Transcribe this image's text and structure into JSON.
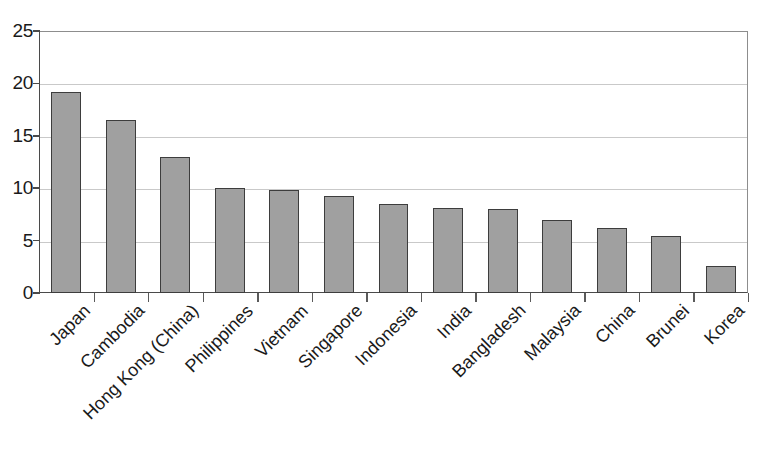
{
  "chart_data": {
    "type": "bar",
    "title": "",
    "subtitle": "",
    "xlabel": "",
    "ylabel": "",
    "ylim": [
      0,
      25
    ],
    "yticks": [
      0,
      5,
      10,
      15,
      20,
      25
    ],
    "ytick_labels": [
      "0",
      "5",
      "10",
      "15",
      "20",
      "25"
    ],
    "grid": true,
    "legend": false,
    "legend_position": "none",
    "orientation": "vertical",
    "bar_color": "#a0a0a0",
    "bar_edge_color": "#3d3d3d",
    "background_color": "#ffffff",
    "gridline_color": "#c9c9c9",
    "axis_color": "#4a4a4a",
    "x_label_rotation": -45,
    "categories": [
      "Japan",
      "Cambodia",
      "Hong Kong (China)",
      "Philippines",
      "Vietnam",
      "Singapore",
      "Indonesia",
      "India",
      "Bangladesh",
      "Malaysia",
      "China",
      "Brunei",
      "Korea"
    ],
    "values": [
      19.2,
      16.5,
      13.0,
      10.0,
      9.8,
      9.3,
      8.5,
      8.1,
      8.0,
      7.0,
      6.2,
      5.4,
      2.6
    ]
  }
}
